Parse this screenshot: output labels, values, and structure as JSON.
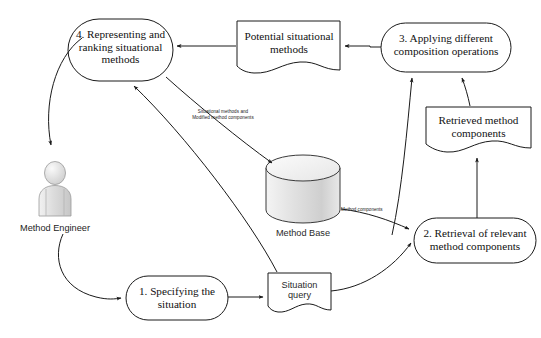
{
  "diagram": {
    "type": "process-flow",
    "background_color": "#ffffff",
    "stroke_color": "#1a1a1a",
    "actors": [
      {
        "id": "method-engineer",
        "label": "Method Engineer",
        "icon": "person-actor-icon"
      }
    ],
    "processes": [
      {
        "id": "process-1",
        "label": "1. Specifying the\nsituation",
        "line1": "1. Specifying the",
        "line2": "situation",
        "shape": "rounded-rectangle"
      },
      {
        "id": "process-2",
        "label": "2. Retrieval of relevant\nmethod components",
        "line1": "2. Retrieval of relevant",
        "line2": "method components",
        "shape": "rounded-rectangle"
      },
      {
        "id": "process-3",
        "label": "3. Applying different\ncomposition operations",
        "line1": "3. Applying different",
        "line2": "composition operations",
        "shape": "rounded-rectangle"
      },
      {
        "id": "process-4",
        "label": "4. Representing and\nranking situational\nmethods",
        "line1": "4. Representing and",
        "line2": "ranking situational",
        "line3": "methods",
        "shape": "rounded-rectangle"
      }
    ],
    "documents": [
      {
        "id": "doc-situation-query",
        "line1": "Situation",
        "line2": "query",
        "shape": "document"
      },
      {
        "id": "doc-retrieved-method-components",
        "line1": "Retrieved method",
        "line2": "components",
        "shape": "document"
      },
      {
        "id": "doc-potential-situational-methods",
        "line1": "Potential situational",
        "line2": "methods",
        "shape": "document"
      }
    ],
    "datastores": [
      {
        "id": "method-base",
        "label": "Method Base",
        "shape": "cylinder"
      }
    ],
    "edge_labels": [
      {
        "id": "edge-label-situational",
        "line1": "Situational methods and",
        "line2": "Modified method components"
      },
      {
        "id": "edge-label-method-components",
        "line1": "Method components"
      }
    ]
  }
}
